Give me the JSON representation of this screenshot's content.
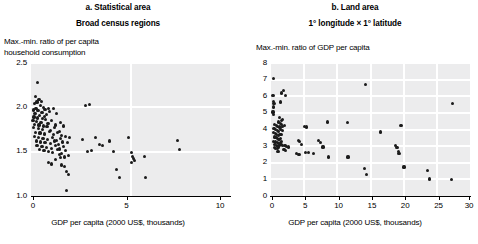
{
  "figure": {
    "background": "#ffffff",
    "marker_color": "#1b1b1b",
    "plot_background": "#ececed",
    "gridline_color": "#ffffff"
  },
  "panels": [
    {
      "id": "a",
      "title": "a. Statistical area",
      "subtitle": "Broad census regions",
      "ylabel": "Max.-min. ratio of per capita\nhousehold consumption",
      "xlabel": "GDP per capita (2000 US$, thousands)",
      "yticks": [
        "2.5",
        "2.0",
        "1.5",
        "1.0"
      ],
      "xticks": [
        "0",
        "5",
        "10"
      ]
    },
    {
      "id": "b",
      "title": "b. Land area",
      "subtitle": "1° longitude × 1° latitude",
      "ylabel": "Max.-min. ratio of GDP per capita",
      "xlabel": "GDP per capita (2000 US$, thousands)",
      "yticks": [
        "8",
        "7",
        "6",
        "5",
        "4",
        "3",
        "2",
        "1",
        "0"
      ],
      "xticks": [
        "0",
        "5",
        "10",
        "15",
        "20",
        "25",
        "30"
      ]
    }
  ],
  "chart_data": [
    {
      "type": "scatter",
      "panel": "a",
      "title": "a. Statistical area",
      "subtitle": "Broad census regions",
      "xlabel": "GDP per capita (2000 US$, thousands)",
      "ylabel": "Max.-min. ratio of per capita household consumption",
      "xlim": [
        0,
        10
      ],
      "ylim": [
        1.0,
        2.5
      ],
      "xticks": [
        0,
        5,
        10
      ],
      "yticks": [
        1.0,
        1.5,
        2.0,
        2.5
      ],
      "grid": true,
      "legend": null,
      "points": [
        [
          0.32,
          2.28
        ],
        [
          0.22,
          2.12
        ],
        [
          0.4,
          2.09
        ],
        [
          0.3,
          2.06
        ],
        [
          0.52,
          2.07
        ],
        [
          0.18,
          2.04
        ],
        [
          0.47,
          2.02
        ],
        [
          0.25,
          1.99
        ],
        [
          0.61,
          2.0
        ],
        [
          0.12,
          1.97
        ],
        [
          0.35,
          1.96
        ],
        [
          0.55,
          1.94
        ],
        [
          0.7,
          1.98
        ],
        [
          0.2,
          1.93
        ],
        [
          0.44,
          1.91
        ],
        [
          0.66,
          1.9
        ],
        [
          0.88,
          1.99
        ],
        [
          0.15,
          1.89
        ],
        [
          0.33,
          1.88
        ],
        [
          0.58,
          1.87
        ],
        [
          0.78,
          1.92
        ],
        [
          0.1,
          1.85
        ],
        [
          0.28,
          1.84
        ],
        [
          0.5,
          1.83
        ],
        [
          0.72,
          1.86
        ],
        [
          0.95,
          1.95
        ],
        [
          1.12,
          1.99
        ],
        [
          1.3,
          1.93
        ],
        [
          0.18,
          1.81
        ],
        [
          0.4,
          1.8
        ],
        [
          0.62,
          1.79
        ],
        [
          0.85,
          1.82
        ],
        [
          1.05,
          1.85
        ],
        [
          1.25,
          1.8
        ],
        [
          1.48,
          1.83
        ],
        [
          0.14,
          1.77
        ],
        [
          0.36,
          1.76
        ],
        [
          0.57,
          1.75
        ],
        [
          0.8,
          1.78
        ],
        [
          1.0,
          1.74
        ],
        [
          1.2,
          1.77
        ],
        [
          1.42,
          1.73
        ],
        [
          1.62,
          1.79
        ],
        [
          0.22,
          1.72
        ],
        [
          0.45,
          1.71
        ],
        [
          0.68,
          1.7
        ],
        [
          0.92,
          1.73
        ],
        [
          1.15,
          1.69
        ],
        [
          1.35,
          1.72
        ],
        [
          1.55,
          1.68
        ],
        [
          0.16,
          1.67
        ],
        [
          0.38,
          1.66
        ],
        [
          0.6,
          1.65
        ],
        [
          0.83,
          1.64
        ],
        [
          1.08,
          1.66
        ],
        [
          1.28,
          1.63
        ],
        [
          1.5,
          1.65
        ],
        [
          1.72,
          1.67
        ],
        [
          0.26,
          1.62
        ],
        [
          0.48,
          1.61
        ],
        [
          0.7,
          1.6
        ],
        [
          0.96,
          1.59
        ],
        [
          1.18,
          1.62
        ],
        [
          1.38,
          1.58
        ],
        [
          1.58,
          1.61
        ],
        [
          0.3,
          1.57
        ],
        [
          0.55,
          1.56
        ],
        [
          0.78,
          1.55
        ],
        [
          1.02,
          1.54
        ],
        [
          1.22,
          1.57
        ],
        [
          1.45,
          1.53
        ],
        [
          1.65,
          1.56
        ],
        [
          1.85,
          1.6
        ],
        [
          0.42,
          1.52
        ],
        [
          0.65,
          1.51
        ],
        [
          0.88,
          1.5
        ],
        [
          1.1,
          1.49
        ],
        [
          1.32,
          1.52
        ],
        [
          1.52,
          1.48
        ],
        [
          1.75,
          1.51
        ],
        [
          1.95,
          1.66
        ],
        [
          1.88,
          1.46
        ],
        [
          1.7,
          1.44
        ],
        [
          1.48,
          1.43
        ],
        [
          1.25,
          1.41
        ],
        [
          1.05,
          1.36
        ],
        [
          0.86,
          1.38
        ],
        [
          1.42,
          1.47
        ],
        [
          1.55,
          1.35
        ],
        [
          1.68,
          1.33
        ],
        [
          1.8,
          1.28
        ],
        [
          1.9,
          1.24
        ],
        [
          1.78,
          1.06
        ],
        [
          2.75,
          2.02
        ],
        [
          2.95,
          2.03
        ],
        [
          2.6,
          1.64
        ],
        [
          2.85,
          1.5
        ],
        [
          3.05,
          1.51
        ],
        [
          3.25,
          1.66
        ],
        [
          3.45,
          1.58
        ],
        [
          3.6,
          1.57
        ],
        [
          3.95,
          1.62
        ],
        [
          4.15,
          1.5
        ],
        [
          4.3,
          1.3
        ],
        [
          4.45,
          1.21
        ],
        [
          4.9,
          1.66
        ],
        [
          5.05,
          1.49
        ],
        [
          5.1,
          1.45
        ],
        [
          5.15,
          1.42
        ],
        [
          5.2,
          1.4
        ],
        [
          5.05,
          1.38
        ],
        [
          5.7,
          1.45
        ],
        [
          5.75,
          1.21
        ],
        [
          7.35,
          1.63
        ],
        [
          7.45,
          1.52
        ]
      ]
    },
    {
      "type": "scatter",
      "panel": "b",
      "title": "b. Land area",
      "subtitle": "1° longitude × 1° latitude",
      "xlabel": "GDP per capita (2000 US$, thousands)",
      "ylabel": "Max.-min. ratio of GDP per capita",
      "xlim": [
        0,
        30
      ],
      "ylim": [
        0,
        8
      ],
      "xticks": [
        0,
        5,
        10,
        15,
        20,
        25,
        30
      ],
      "yticks": [
        0,
        1,
        2,
        3,
        4,
        5,
        6,
        7,
        8
      ],
      "grid": true,
      "legend": null,
      "points": [
        [
          0.35,
          7.05
        ],
        [
          0.3,
          6.05
        ],
        [
          1.55,
          6.2
        ],
        [
          1.9,
          6.35
        ],
        [
          2.15,
          6.05
        ],
        [
          0.4,
          5.7
        ],
        [
          0.45,
          5.55
        ],
        [
          1.45,
          5.65
        ],
        [
          0.35,
          5.35
        ],
        [
          0.3,
          5.05
        ],
        [
          0.42,
          4.9
        ],
        [
          1.3,
          4.7
        ],
        [
          1.55,
          4.55
        ],
        [
          1.7,
          4.6
        ],
        [
          1.15,
          4.45
        ],
        [
          1.4,
          4.38
        ],
        [
          1.62,
          4.32
        ],
        [
          0.55,
          4.3
        ],
        [
          0.8,
          4.25
        ],
        [
          1.0,
          4.2
        ],
        [
          1.25,
          4.15
        ],
        [
          1.48,
          4.1
        ],
        [
          1.75,
          4.18
        ],
        [
          2.05,
          4.22
        ],
        [
          0.45,
          4.05
        ],
        [
          0.7,
          4.0
        ],
        [
          0.95,
          3.95
        ],
        [
          1.18,
          3.9
        ],
        [
          1.42,
          3.98
        ],
        [
          1.68,
          3.92
        ],
        [
          0.38,
          3.8
        ],
        [
          0.62,
          3.75
        ],
        [
          0.88,
          3.7
        ],
        [
          1.1,
          3.65
        ],
        [
          1.35,
          3.72
        ],
        [
          1.58,
          3.68
        ],
        [
          0.5,
          3.55
        ],
        [
          0.75,
          3.5
        ],
        [
          0.98,
          3.45
        ],
        [
          1.22,
          3.42
        ],
        [
          1.45,
          3.48
        ],
        [
          0.42,
          3.3
        ],
        [
          0.68,
          3.25
        ],
        [
          0.92,
          3.2
        ],
        [
          1.15,
          3.18
        ],
        [
          1.38,
          3.22
        ],
        [
          1.6,
          3.28
        ],
        [
          0.55,
          3.1
        ],
        [
          0.8,
          3.05
        ],
        [
          1.05,
          3.0
        ],
        [
          1.28,
          3.05
        ],
        [
          1.5,
          3.1
        ],
        [
          1.72,
          3.02
        ],
        [
          0.48,
          2.92
        ],
        [
          0.72,
          2.88
        ],
        [
          0.95,
          2.85
        ],
        [
          1.18,
          2.9
        ],
        [
          2.1,
          3.02
        ],
        [
          2.35,
          3.0
        ],
        [
          2.6,
          2.95
        ],
        [
          1.95,
          2.78
        ],
        [
          2.2,
          2.75
        ],
        [
          1.05,
          2.7
        ],
        [
          4.2,
          3.35
        ],
        [
          4.55,
          3.1
        ],
        [
          4.35,
          3.28
        ],
        [
          5.05,
          4.2
        ],
        [
          5.35,
          4.15
        ],
        [
          3.9,
          2.55
        ],
        [
          4.1,
          2.52
        ],
        [
          4.35,
          2.5
        ],
        [
          5.2,
          2.6
        ],
        [
          5.7,
          2.62
        ],
        [
          6.4,
          2.55
        ],
        [
          7.15,
          3.35
        ],
        [
          7.5,
          3.2
        ],
        [
          7.85,
          2.95
        ],
        [
          8.55,
          4.45
        ],
        [
          8.7,
          2.35
        ],
        [
          11.55,
          4.4
        ],
        [
          11.6,
          2.35
        ],
        [
          14.15,
          1.65
        ],
        [
          14.35,
          1.28
        ],
        [
          16.55,
          3.85
        ],
        [
          14.25,
          6.7
        ],
        [
          18.75,
          3.05
        ],
        [
          19.0,
          2.9
        ],
        [
          19.2,
          2.7
        ],
        [
          19.3,
          2.55
        ],
        [
          19.6,
          4.25
        ],
        [
          20.05,
          1.75
        ],
        [
          23.55,
          1.55
        ],
        [
          23.9,
          1.02
        ],
        [
          27.2,
          1.0
        ],
        [
          27.35,
          5.55
        ]
      ]
    }
  ]
}
